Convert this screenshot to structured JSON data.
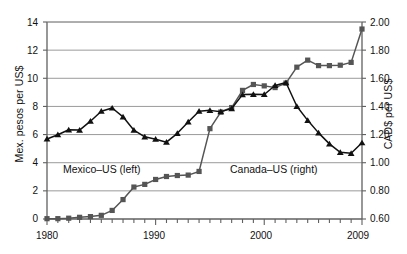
{
  "chart_data": {
    "type": "line",
    "title": "",
    "xlabel": "",
    "x": [
      1980,
      1981,
      1982,
      1983,
      1984,
      1985,
      1986,
      1987,
      1988,
      1989,
      1990,
      1991,
      1992,
      1993,
      1994,
      1995,
      1996,
      1997,
      1998,
      1999,
      2000,
      2001,
      2002,
      2003,
      2004,
      2005,
      2006,
      2007,
      2008,
      2009
    ],
    "xlim": [
      1980,
      2009
    ],
    "xticks": [
      1980,
      1990,
      2000,
      2009
    ],
    "xtick_labels": [
      "1980",
      "1990",
      "2000",
      "2009"
    ],
    "grid": true,
    "legend_position": "inline-annotations",
    "series": [
      {
        "name": "Mexico-US (left)",
        "axis": "left",
        "marker": "square",
        "color": "#555555",
        "ylabel": "Mex. pesos per US$",
        "ylim": [
          0,
          14
        ],
        "yticks": [
          0,
          2,
          4,
          6,
          8,
          10,
          12,
          14
        ],
        "ytick_labels": [
          "0",
          "2",
          "4",
          "6",
          "8",
          "10",
          "12",
          "14"
        ],
        "values": [
          0.023,
          0.025,
          0.057,
          0.12,
          0.17,
          0.26,
          0.61,
          1.38,
          2.27,
          2.46,
          2.81,
          3.02,
          3.09,
          3.12,
          3.38,
          6.42,
          7.6,
          7.92,
          9.14,
          9.56,
          9.46,
          9.34,
          9.66,
          10.79,
          11.29,
          10.9,
          10.9,
          10.93,
          11.13,
          13.5
        ]
      },
      {
        "name": "Canada-US (right)",
        "axis": "right",
        "marker": "triangle",
        "color": "#111111",
        "ylabel": "CAD$ per US$",
        "ylim": [
          0.6,
          2.0
        ],
        "yticks": [
          0.6,
          0.8,
          1.0,
          1.2,
          1.4,
          1.6,
          1.8,
          2.0
        ],
        "ytick_labels": [
          "0.60",
          "0.80",
          "1.00",
          "1.20",
          "1.40",
          "1.60",
          "1.80",
          "2.00"
        ],
        "values": [
          1.169,
          1.199,
          1.234,
          1.232,
          1.295,
          1.366,
          1.389,
          1.326,
          1.231,
          1.184,
          1.167,
          1.146,
          1.209,
          1.29,
          1.366,
          1.372,
          1.363,
          1.385,
          1.484,
          1.486,
          1.485,
          1.549,
          1.57,
          1.401,
          1.301,
          1.212,
          1.134,
          1.074,
          1.067,
          1.142
        ]
      }
    ],
    "annotations": [
      {
        "text": "Mexico-US (left)",
        "x": 1982.4,
        "y_left": 3.7
      },
      {
        "text": "Canada-US (right)",
        "x": 1997.5,
        "y_left": 3.7
      }
    ]
  },
  "axes": {
    "left_title": "Mex. pesos per US$",
    "right_title": "CAD$ per US$",
    "left_ticks": [
      "14",
      "12",
      "10",
      "8",
      "6",
      "4",
      "2",
      "0"
    ],
    "right_ticks": [
      "2.00",
      "1.80",
      "1.60",
      "1.40",
      "1.20",
      "1.00",
      "0.80",
      "0.60"
    ],
    "x_ticks": [
      "1980",
      "1990",
      "2000",
      "2009"
    ]
  },
  "labels": {
    "mexico": "Mexico–US (left)",
    "canada": "Canada–US (right)"
  },
  "colors": {
    "mexico_series": "#555555",
    "canada_series": "#111111",
    "grid": "#808080",
    "axis": "#606060",
    "background": "#ffffff"
  }
}
